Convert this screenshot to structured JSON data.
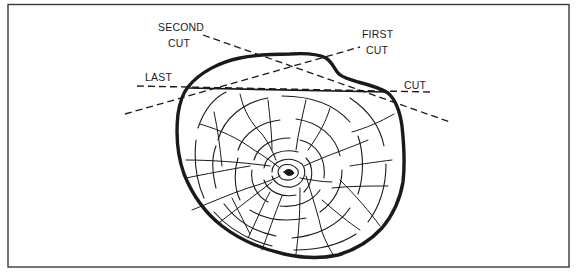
{
  "diagram": {
    "type": "log-cutting-sequence",
    "labels": {
      "second_cut_line1": "SECOND",
      "second_cut_line2": "CUT",
      "first_cut_line1": "FIRST",
      "first_cut_line2": "CUT",
      "last_cut_left": "LAST",
      "last_cut_right": "CUT"
    },
    "colors": {
      "ink": "#1a1a1a",
      "frame": "#3a3a3a",
      "background": "#ffffff"
    },
    "elements": {
      "log_cross_section": "tree-rings-with-radial-cracks",
      "cuts": [
        "FIRST CUT",
        "SECOND CUT",
        "LAST CUT"
      ]
    }
  }
}
